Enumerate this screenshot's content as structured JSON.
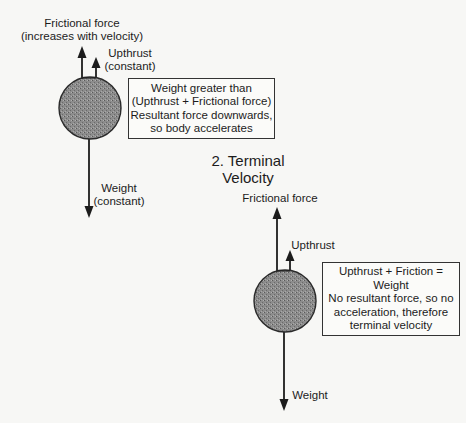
{
  "diagram": {
    "type": "free-body force diagram",
    "colors": {
      "background": "#f7f7f5",
      "ink": "#1c1c1c",
      "sphere_fill": "#8a8a8a",
      "sphere_stroke": "#2a2a2a"
    },
    "scene1": {
      "labels": {
        "friction_line1": "Frictional force",
        "friction_line2": "(increases with velocity)",
        "upthrust_line1": "Upthrust",
        "upthrust_line2": "(constant)",
        "weight_line1": "Weight",
        "weight_line2": "(constant)"
      },
      "box": {
        "lines": [
          "Weight greater than",
          "(Upthrust + Frictional force)",
          "Resultant force downwards,",
          "so body accelerates"
        ]
      }
    },
    "scene2": {
      "heading_line1": "2. Terminal",
      "heading_line2": "Velocity",
      "labels": {
        "friction": "Frictional force",
        "upthrust": "Upthrust",
        "weight": "Weight"
      },
      "box": {
        "lines": [
          "Upthrust + Friction =",
          "Weight",
          "No resultant force, so no",
          "acceleration, therefore",
          "terminal velocity"
        ]
      }
    }
  }
}
